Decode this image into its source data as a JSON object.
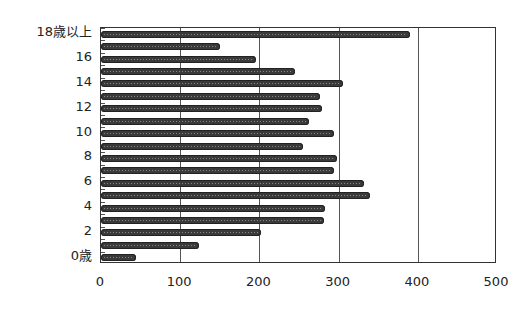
{
  "chart_data": {
    "type": "bar",
    "orientation": "horizontal",
    "title": "",
    "xlabel": "",
    "ylabel": "",
    "categories": [
      "0歳",
      "1",
      "2",
      "3",
      "4",
      "5",
      "6",
      "7",
      "8",
      "9",
      "10",
      "11",
      "12",
      "13",
      "14",
      "15",
      "16",
      "17",
      "18歳以上"
    ],
    "values": [
      44,
      124,
      202,
      282,
      283,
      340,
      332,
      294,
      298,
      255,
      294,
      262,
      279,
      276,
      305,
      245,
      196,
      150,
      390
    ],
    "xlim": [
      0,
      500
    ],
    "xticks": [
      "0",
      "100",
      "200",
      "300",
      "400",
      "500"
    ],
    "yticklabels_shown": [
      "0歳",
      "2",
      "4",
      "6",
      "8",
      "10",
      "12",
      "14",
      "16",
      "18歳以上"
    ],
    "grid": {
      "vertical": true,
      "horizontal": false
    },
    "bar_color": "#3a3a3a",
    "legend": null
  }
}
